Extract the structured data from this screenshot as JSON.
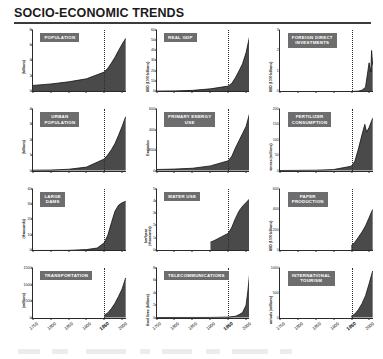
{
  "header": {
    "title": "SOCIO-ECONOMIC TRENDS"
  },
  "axis": {
    "xticks": [
      "1750",
      "1800",
      "1850",
      "1900",
      "1950",
      "2000"
    ],
    "xbold": "1950",
    "marker_year": "1950"
  },
  "colors": {
    "chip_bg": "#6d6d6d",
    "chip_text": "#ffffff",
    "axis": "#2a2a2a",
    "area_fill": "#4a4a4a",
    "rule": "#3b3b3b"
  },
  "chart_data": [
    {
      "type": "area",
      "title": "POPULATION",
      "ylabel": "(billions)",
      "xlabel": "",
      "ylim": [
        0,
        8
      ],
      "yticks": [
        0,
        2,
        4,
        6,
        8
      ],
      "xlim": [
        1750,
        2010
      ],
      "x": [
        1750,
        1800,
        1850,
        1900,
        1950,
        1960,
        1970,
        1980,
        1990,
        2000,
        2010
      ],
      "values": [
        0.79,
        0.98,
        1.26,
        1.65,
        2.53,
        3.03,
        3.7,
        4.45,
        5.32,
        6.14,
        6.9
      ]
    },
    {
      "type": "area",
      "title": "REAL GDP",
      "ylabel": "USD (1000 billions)",
      "xlabel": "",
      "ylim": [
        0,
        60
      ],
      "yticks": [
        0,
        10,
        20,
        30,
        40,
        50,
        60
      ],
      "xlim": [
        1750,
        2010
      ],
      "x": [
        1750,
        1800,
        1850,
        1900,
        1950,
        1960,
        1970,
        1980,
        1990,
        2000,
        2010
      ],
      "values": [
        0.4,
        0.6,
        1.1,
        2.6,
        5.3,
        8.0,
        13.5,
        20.0,
        27.0,
        38.0,
        54.0
      ]
    },
    {
      "type": "area",
      "title": "FOREIGN DIRECT\nINVESTMENTS",
      "ylabel": "USD (1000 billions)",
      "xlabel": "",
      "ylim": [
        0,
        3
      ],
      "yticks": [
        0,
        1,
        2,
        3
      ],
      "xlim": [
        1750,
        2010
      ],
      "x": [
        1750,
        1850,
        1900,
        1950,
        1970,
        1980,
        1990,
        2000,
        2005,
        2007,
        2010
      ],
      "values": [
        0.0,
        0.0,
        0.0,
        0.0,
        0.02,
        0.06,
        0.21,
        1.4,
        0.95,
        2.0,
        1.3
      ]
    },
    {
      "type": "area",
      "title": "URBAN\nPOPULATION",
      "ylabel": "(billions)",
      "xlabel": "",
      "ylim": [
        0,
        4
      ],
      "yticks": [
        0,
        1,
        2,
        3,
        4
      ],
      "xlim": [
        1750,
        2010
      ],
      "x": [
        1750,
        1800,
        1850,
        1900,
        1950,
        1960,
        1970,
        1980,
        1990,
        2000,
        2010
      ],
      "values": [
        0.02,
        0.03,
        0.08,
        0.22,
        0.75,
        1.02,
        1.35,
        1.75,
        2.29,
        2.86,
        3.5
      ]
    },
    {
      "type": "area",
      "title": "PRIMARY ENERGY\nUSE",
      "ylabel": "Exajoules",
      "xlabel": "",
      "ylim": [
        0,
        600
      ],
      "yticks": [
        0,
        200,
        400,
        600
      ],
      "xlim": [
        1750,
        2010
      ],
      "x": [
        1750,
        1800,
        1850,
        1900,
        1950,
        1960,
        1970,
        1980,
        1990,
        2000,
        2010
      ],
      "values": [
        10,
        14,
        22,
        45,
        95,
        140,
        220,
        290,
        360,
        430,
        560
      ]
    },
    {
      "type": "area",
      "title": "FERTILIZER\nCONSUMPTION",
      "ylabel": "tonnes (millions)",
      "xlabel": "",
      "ylim": [
        0,
        200
      ],
      "yticks": [
        0,
        50,
        100,
        150,
        200
      ],
      "xlim": [
        1750,
        2010
      ],
      "x": [
        1750,
        1850,
        1900,
        1950,
        1960,
        1970,
        1980,
        1988,
        1993,
        2000,
        2010
      ],
      "values": [
        0,
        1,
        3,
        14,
        30,
        70,
        116,
        150,
        125,
        140,
        170
      ]
    },
    {
      "type": "area",
      "title": "LARGE\nDAMS",
      "ylabel": "(thousands)",
      "xlabel": "",
      "ylim": [
        0,
        40
      ],
      "yticks": [
        0,
        10,
        20,
        30,
        40
      ],
      "xlim": [
        1750,
        2010
      ],
      "x": [
        1750,
        1850,
        1900,
        1930,
        1950,
        1960,
        1970,
        1980,
        1990,
        2000,
        2010
      ],
      "values": [
        0,
        0.1,
        0.6,
        1.6,
        5.0,
        10.0,
        18.0,
        25.5,
        29.5,
        31.0,
        32.0
      ]
    },
    {
      "type": "area",
      "title": "WATER USE",
      "ylabel": "km³/year (thousands)",
      "xlabel": "",
      "ylim": [
        0,
        5
      ],
      "yticks": [
        0,
        1,
        2,
        3,
        4,
        5
      ],
      "xlim": [
        1750,
        2010
      ],
      "x": [
        1900,
        1910,
        1930,
        1950,
        1960,
        1970,
        1980,
        1990,
        2000,
        2010
      ],
      "values": [
        0.68,
        0.8,
        1.1,
        1.4,
        1.9,
        2.6,
        3.2,
        3.6,
        3.9,
        4.2
      ]
    },
    {
      "type": "area",
      "title": "PAPER\nPRODUCTION",
      "ylabel": "USD (1000 billions)",
      "xlabel": "",
      "ylim": [
        0,
        600
      ],
      "yticks": [
        0,
        200,
        400,
        600
      ],
      "xlim": [
        1750,
        2010
      ],
      "x": [
        1950,
        1960,
        1970,
        1980,
        1990,
        2000,
        2010
      ],
      "values": [
        45,
        80,
        130,
        180,
        240,
        320,
        400
      ]
    },
    {
      "type": "area",
      "title": "TRANSPORTATION",
      "ylabel": "(millions)",
      "xlabel": "",
      "ylim": [
        0,
        1500
      ],
      "yticks": [
        0,
        500,
        1000,
        1500
      ],
      "xlim": [
        1750,
        2010
      ],
      "x": [
        1950,
        1960,
        1970,
        1980,
        1990,
        2000,
        2010
      ],
      "values": [
        70,
        140,
        270,
        430,
        640,
        860,
        1200
      ]
    },
    {
      "type": "area",
      "title": "TELECOMMUNICATIONS",
      "ylabel": "fixed lines (billions)",
      "xlabel": "",
      "ylim": [
        0,
        8
      ],
      "yticks": [
        0,
        2,
        4,
        6,
        8
      ],
      "xlim": [
        1750,
        2010
      ],
      "x": [
        1750,
        1900,
        1950,
        1970,
        1980,
        1990,
        2000,
        2005,
        2010
      ],
      "values": [
        0,
        0.01,
        0.07,
        0.2,
        0.45,
        0.8,
        2.0,
        4.3,
        7.2
      ]
    },
    {
      "type": "area",
      "title": "INTERNATIONAL\nTOURISM",
      "ylabel": "arrivals (millions)",
      "xlabel": "",
      "ylim": [
        0,
        1000
      ],
      "yticks": [
        0,
        500,
        1000
      ],
      "xlim": [
        1750,
        2010
      ],
      "x": [
        1950,
        1960,
        1970,
        1980,
        1990,
        2000,
        2010
      ],
      "values": [
        25,
        70,
        160,
        280,
        440,
        680,
        940
      ]
    }
  ]
}
